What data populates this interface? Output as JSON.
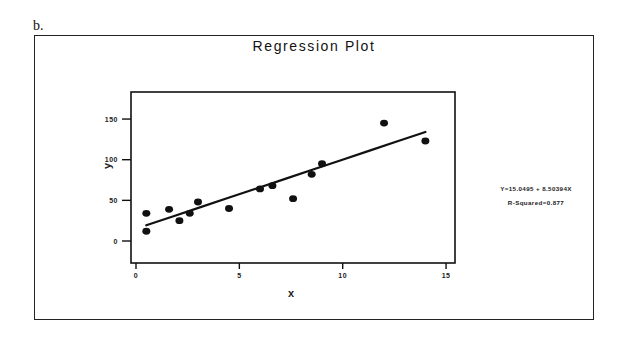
{
  "panel_label": "b.",
  "chart_data": {
    "type": "scatter",
    "title": "Regression Plot",
    "xlabel": "X",
    "ylabel": "Y",
    "xlim": [
      -0.3,
      15.4
    ],
    "ylim": [
      -27,
      185
    ],
    "xticks": [
      0,
      5,
      10,
      15
    ],
    "yticks": [
      0,
      50,
      100,
      150
    ],
    "grid": false,
    "legend": null,
    "points": [
      {
        "x": 0.5,
        "y": 34
      },
      {
        "x": 0.5,
        "y": 12
      },
      {
        "x": 1.6,
        "y": 39
      },
      {
        "x": 2.1,
        "y": 25
      },
      {
        "x": 2.6,
        "y": 34
      },
      {
        "x": 3.0,
        "y": 48
      },
      {
        "x": 4.5,
        "y": 40
      },
      {
        "x": 6.0,
        "y": 64
      },
      {
        "x": 6.6,
        "y": 68
      },
      {
        "x": 7.6,
        "y": 52
      },
      {
        "x": 8.5,
        "y": 82
      },
      {
        "x": 9.0,
        "y": 95
      },
      {
        "x": 12.0,
        "y": 145
      },
      {
        "x": 14.0,
        "y": 123
      }
    ],
    "fit_line": {
      "intercept": 15.0495,
      "slope": 8.50394,
      "x_range": [
        0.5,
        14.0
      ]
    },
    "annotations": {
      "equation": "Y=15.0495 + 8.50394X",
      "r_squared": "R-Squared=0.877"
    }
  }
}
